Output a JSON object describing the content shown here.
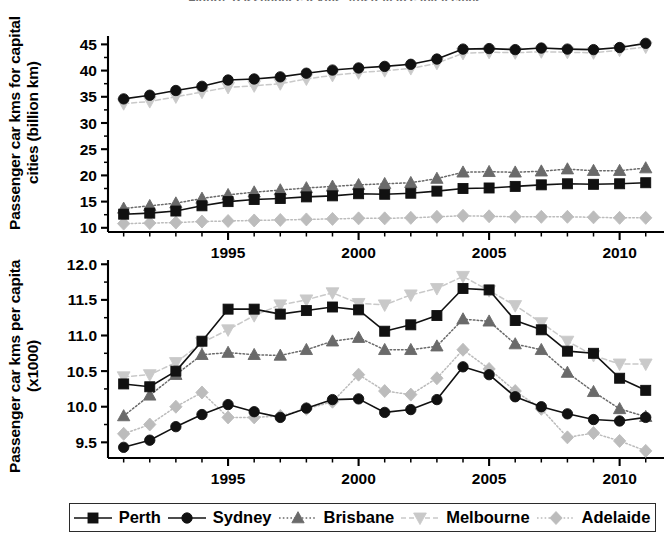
{
  "figure": {
    "title_clipped": "Figure: Passenger car kms, Australian capital cities",
    "background": "#ffffff"
  },
  "colors": {
    "perth": "#111111",
    "sydney": "#111111",
    "brisbane": "#6a6a6a",
    "melbourne": "#c9c9c9",
    "adelaide": "#bcbcbc",
    "axis": "#000000",
    "legend_border": "#2b2b2b"
  },
  "legend": {
    "position": "bottom",
    "items": [
      {
        "label": "Perth",
        "marker": "square",
        "color": "#111111",
        "line": "solid"
      },
      {
        "label": "Sydney",
        "marker": "circle",
        "color": "#111111",
        "line": "solid"
      },
      {
        "label": "Brisbane",
        "marker": "triangle-up",
        "color": "#6a6a6a",
        "line": "dotted"
      },
      {
        "label": "Melbourne",
        "marker": "triangle-down",
        "color": "#c9c9c9",
        "line": "dashed"
      },
      {
        "label": "Adelaide",
        "marker": "diamond",
        "color": "#bcbcbc",
        "line": "dotted"
      }
    ]
  },
  "chart_data": [
    {
      "id": "top",
      "type": "line",
      "title": "",
      "xlabel": "",
      "ylabel": "Passenger car kms for capital cities (billion km)",
      "x": [
        1991,
        1992,
        1993,
        1994,
        1995,
        1996,
        1997,
        1998,
        1999,
        2000,
        2001,
        2002,
        2003,
        2004,
        2005,
        2006,
        2007,
        2008,
        2009,
        2010,
        2011
      ],
      "xlim": [
        1990.4,
        2011.7
      ],
      "ylim": [
        9.2,
        46.6
      ],
      "xticks": [
        1995,
        2000,
        2005,
        2010
      ],
      "xticklabels": [
        "1995",
        "2000",
        "2005",
        "2010"
      ],
      "xminortick_step": 1,
      "yticks": [
        10,
        15,
        20,
        25,
        30,
        35,
        40,
        45
      ],
      "yticklabels": [
        "10",
        "15",
        "20",
        "25",
        "30",
        "35",
        "40",
        "45"
      ],
      "grid": false,
      "series": [
        {
          "name": "Perth",
          "values": [
            12.6,
            12.8,
            13.2,
            14.2,
            15.0,
            15.4,
            15.6,
            15.9,
            16.1,
            16.5,
            16.4,
            16.6,
            17.0,
            17.5,
            17.6,
            17.9,
            18.2,
            18.4,
            18.3,
            18.4,
            18.6
          ]
        },
        {
          "name": "Sydney",
          "values": [
            34.6,
            35.3,
            36.2,
            37.0,
            38.2,
            38.4,
            38.8,
            39.5,
            40.1,
            40.5,
            40.8,
            41.2,
            42.2,
            44.1,
            44.2,
            44.0,
            44.3,
            44.1,
            44.0,
            44.4,
            45.2
          ]
        },
        {
          "name": "Brisbane",
          "values": [
            13.7,
            14.2,
            14.7,
            15.6,
            16.3,
            16.8,
            17.2,
            17.6,
            17.9,
            18.2,
            18.4,
            18.6,
            19.4,
            20.6,
            20.7,
            20.6,
            20.8,
            21.2,
            20.9,
            20.9,
            21.4
          ]
        },
        {
          "name": "Melbourne",
          "values": [
            33.7,
            34.1,
            35.0,
            35.9,
            36.8,
            37.1,
            37.5,
            38.4,
            39.1,
            39.6,
            40.0,
            40.4,
            41.4,
            43.3,
            43.5,
            43.4,
            43.6,
            43.5,
            43.4,
            43.9,
            44.5
          ]
        },
        {
          "name": "Adelaide",
          "values": [
            10.8,
            10.9,
            11.0,
            11.2,
            11.3,
            11.4,
            11.5,
            11.6,
            11.7,
            11.8,
            11.8,
            11.9,
            12.1,
            12.3,
            12.2,
            12.1,
            12.1,
            12.1,
            12.0,
            11.9,
            11.9
          ]
        }
      ]
    },
    {
      "id": "bottom",
      "type": "line",
      "title": "",
      "xlabel": "",
      "ylabel": "Passenger car kms per capita (x1000)",
      "x": [
        1991,
        1992,
        1993,
        1994,
        1995,
        1996,
        1997,
        1998,
        1999,
        2000,
        2001,
        2002,
        2003,
        2004,
        2005,
        2006,
        2007,
        2008,
        2009,
        2010,
        2011
      ],
      "xlim": [
        1990.4,
        2011.7
      ],
      "ylim": [
        9.28,
        12.06
      ],
      "xticks": [
        1995,
        2000,
        2005,
        2010
      ],
      "xticklabels": [
        "1995",
        "2000",
        "2005",
        "2010"
      ],
      "xminortick_step": 1,
      "yticks": [
        9.5,
        10.0,
        10.5,
        11.0,
        11.5,
        12.0
      ],
      "yticklabels": [
        "9.5",
        "10.0",
        "10.5",
        "11.0",
        "11.5",
        "12.0"
      ],
      "grid": false,
      "series": [
        {
          "name": "Perth",
          "values": [
            10.32,
            10.28,
            10.5,
            10.92,
            11.37,
            11.37,
            11.3,
            11.35,
            11.4,
            11.36,
            11.06,
            11.15,
            11.28,
            11.66,
            11.64,
            11.21,
            11.08,
            10.78,
            10.75,
            10.4,
            10.23
          ]
        },
        {
          "name": "Sydney",
          "values": [
            9.43,
            9.53,
            9.72,
            9.89,
            10.03,
            9.93,
            9.85,
            9.98,
            10.1,
            10.11,
            9.92,
            9.96,
            10.1,
            10.56,
            10.45,
            10.14,
            10.0,
            9.9,
            9.82,
            9.8,
            9.85
          ]
        },
        {
          "name": "Brisbane",
          "values": [
            9.87,
            10.16,
            10.45,
            10.73,
            10.76,
            10.73,
            10.72,
            10.8,
            10.92,
            10.97,
            10.8,
            10.8,
            10.85,
            11.23,
            11.2,
            10.88,
            10.8,
            10.48,
            10.21,
            9.97,
            9.86
          ]
        },
        {
          "name": "Melbourne",
          "values": [
            10.42,
            10.45,
            10.62,
            10.9,
            11.08,
            11.28,
            11.43,
            11.5,
            11.6,
            11.45,
            11.43,
            11.57,
            11.66,
            11.83,
            11.63,
            11.42,
            11.18,
            10.92,
            10.72,
            10.6,
            10.6
          ]
        },
        {
          "name": "Adelaide",
          "values": [
            9.62,
            9.75,
            10.0,
            10.2,
            9.85,
            9.85,
            9.87,
            9.97,
            10.07,
            10.45,
            10.22,
            10.17,
            10.4,
            10.8,
            10.53,
            10.22,
            9.97,
            9.57,
            9.63,
            9.52,
            9.38
          ]
        }
      ]
    }
  ]
}
